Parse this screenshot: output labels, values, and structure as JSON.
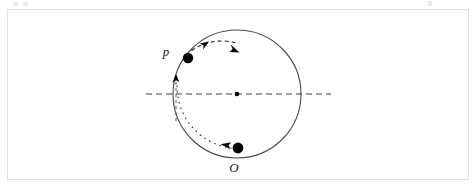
{
  "figure": {
    "type": "physics-diagram",
    "background_color": "#ffffff",
    "frame_color": "#e2e2e2",
    "stroke_color": "#3a3a3a",
    "marker_color": "#000000"
  },
  "labels": {
    "point_p": "p",
    "point_o": "O"
  },
  "geometry": {
    "circle": {
      "cx": 237,
      "cy": 94,
      "r": 64
    },
    "center_dot": {
      "cx": 237,
      "cy": 94,
      "r": 2.2
    },
    "axis_line": {
      "x1": 146,
      "y1": 94,
      "x2": 331,
      "y2": 94,
      "style": "dashed"
    },
    "vertical_dash": {
      "x": 176,
      "y1": 74,
      "y2": 122,
      "style": "dashed"
    },
    "ball_p": {
      "cx": 188,
      "cy": 58,
      "r": 5.2
    },
    "ball_o": {
      "cx": 238,
      "cy": 148,
      "r": 5.4
    },
    "dashed_arc": {
      "from": [
        188,
        58
      ],
      "to": [
        236,
        44
      ],
      "style": "dashed"
    },
    "dotted_arc": {
      "from": [
        178,
        84
      ],
      "to": [
        230,
        147
      ],
      "style": "dotted"
    }
  },
  "annotations": {
    "arrow_up_on_axis": "up-arrowhead",
    "arrow_mid_arc": "up-right-arrowhead",
    "arrow_end_arc": "down-right-arrowhead",
    "arrow_bottom": "left-arrowhead"
  }
}
